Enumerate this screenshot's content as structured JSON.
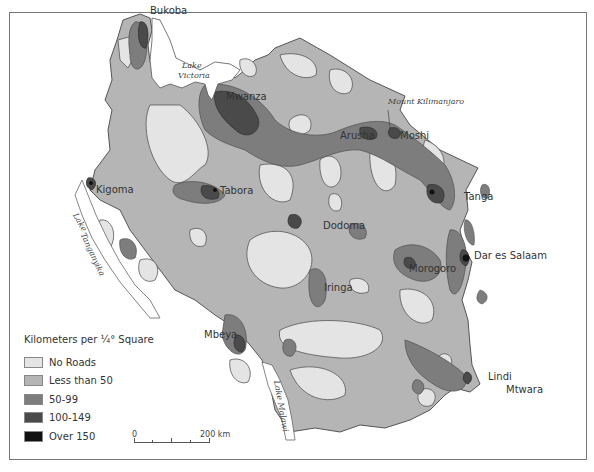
{
  "map": {
    "country": "Tanzania",
    "cities": [
      {
        "name": "Bukoba",
        "x": 149,
        "y": 12
      },
      {
        "name": "Mwanza",
        "x": 224,
        "y": 93
      },
      {
        "name": "Arusha",
        "x": 340,
        "y": 131
      },
      {
        "name": "Moshi",
        "x": 401,
        "y": 131
      },
      {
        "name": "Kigoma",
        "x": 95,
        "y": 184
      },
      {
        "name": "Tabora",
        "x": 220,
        "y": 186
      },
      {
        "name": "Tanga",
        "x": 464,
        "y": 192
      },
      {
        "name": "Dodoma",
        "x": 322,
        "y": 220
      },
      {
        "name": "Dar es Salaam",
        "x": 473,
        "y": 252
      },
      {
        "name": "Morogoro",
        "x": 408,
        "y": 262
      },
      {
        "name": "Iringa",
        "x": 323,
        "y": 282
      },
      {
        "name": "Mbeya",
        "x": 204,
        "y": 331
      },
      {
        "name": "Lindi",
        "x": 488,
        "y": 373
      },
      {
        "name": "Mtwara",
        "x": 506,
        "y": 385
      }
    ],
    "water_labels": [
      {
        "name": "Lake Victoria",
        "line1": "Lake",
        "line2": "Victoria",
        "x": 180,
        "y": 62
      },
      {
        "name": "Lake Tanganyika",
        "line1": "Lake",
        "line2": "Tanganyika"
      },
      {
        "name": "Lake Malawi",
        "line1": "Lake Malawi"
      }
    ],
    "feature_labels": [
      {
        "name": "Mount Kilimanjaro",
        "x": 388,
        "y": 98
      }
    ]
  },
  "legend": {
    "title": "Kilometers per ¼° Square",
    "items": [
      {
        "label": "No Roads",
        "color": "#e4e4e4"
      },
      {
        "label": "Less than 50",
        "color": "#b5b5b5"
      },
      {
        "label": "50-99",
        "color": "#7d7d7d"
      },
      {
        "label": "100-149",
        "color": "#4a4a4a"
      },
      {
        "label": "Over 150",
        "color": "#111111"
      }
    ]
  },
  "scale_bar": {
    "start": "0",
    "end": "200",
    "unit": "km"
  },
  "colors": {
    "no_roads": "#e4e4e4",
    "lt50": "#b5b5b5",
    "r50_99": "#7d7d7d",
    "r100_149": "#4a4a4a",
    "over150": "#111111",
    "outline": "#555555"
  }
}
